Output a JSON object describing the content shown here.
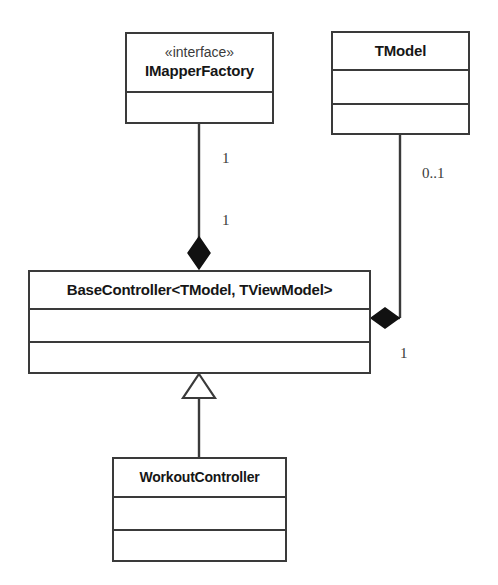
{
  "diagram": {
    "kind": "uml-class-diagram",
    "background_color": "#ffffff",
    "line_color": "#3a3a3a",
    "text_color": "#161616",
    "classes": [
      {
        "id": "imapperfactory",
        "stereotype": "«interface»",
        "name": "IMapperFactory",
        "compartments": [
          "",
          ""
        ]
      },
      {
        "id": "tmodel",
        "stereotype": "",
        "name": "TModel",
        "compartments": [
          "",
          ""
        ]
      },
      {
        "id": "basecontroller",
        "stereotype": "",
        "name": "BaseController<TModel, TViewModel>",
        "compartments": [
          "",
          ""
        ]
      },
      {
        "id": "workoutcontroller",
        "stereotype": "",
        "name": "WorkoutController",
        "compartments": [
          "",
          ""
        ]
      }
    ],
    "relationships": [
      {
        "id": "imapperfactory-basecontroller",
        "type": "composition",
        "from": "basecontroller",
        "to": "imapperfactory",
        "source_multiplicity": "1",
        "target_multiplicity": "1",
        "diamond": "filled"
      },
      {
        "id": "tmodel-basecontroller",
        "type": "composition",
        "from": "basecontroller",
        "to": "tmodel",
        "source_multiplicity": "1",
        "target_multiplicity": "0..1",
        "diamond": "filled"
      },
      {
        "id": "workoutcontroller-basecontroller",
        "type": "generalization",
        "from": "workoutcontroller",
        "to": "basecontroller",
        "source_multiplicity": "",
        "target_multiplicity": "",
        "arrow": "hollow-triangle"
      }
    ],
    "multiplicity_labels": [
      {
        "id": "label-imapper-upper",
        "text": "1"
      },
      {
        "id": "label-imapper-lower",
        "text": "1"
      },
      {
        "id": "label-tmodel-upper",
        "text": "0..1"
      },
      {
        "id": "label-tmodel-lower",
        "text": "1"
      }
    ]
  }
}
